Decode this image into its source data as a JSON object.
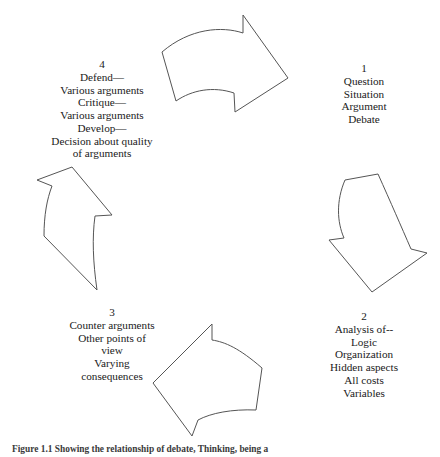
{
  "figure": {
    "caption": "Figure 1.1    Showing the relationship of debate, Thinking, being a",
    "line_color": "#555555",
    "text_color": "#1a1a1a",
    "background_color": "#ffffff"
  },
  "stages": [
    {
      "number": "1",
      "lines": [
        "Question",
        "Situation",
        "Argument",
        "Debate"
      ]
    },
    {
      "number": "2",
      "lines": [
        "Analysis of--",
        "Logic",
        "Organization",
        "Hidden aspects",
        "All costs",
        "Variables"
      ]
    },
    {
      "number": "3",
      "lines": [
        "Counter arguments",
        "Other points of",
        "view",
        "Varying",
        "consequences"
      ]
    },
    {
      "number": "4",
      "lines": [
        "Defend—",
        "Various arguments",
        "Critique—",
        "Various arguments",
        "Develop—",
        "Decision about quality",
        "of arguments"
      ]
    }
  ],
  "arrows": [
    {
      "name": "arrow-top-right",
      "direction": "clockwise-top"
    },
    {
      "name": "arrow-right-down",
      "direction": "clockwise-right"
    },
    {
      "name": "arrow-bottom-left",
      "direction": "clockwise-bottom"
    },
    {
      "name": "arrow-left-up",
      "direction": "clockwise-left"
    }
  ]
}
